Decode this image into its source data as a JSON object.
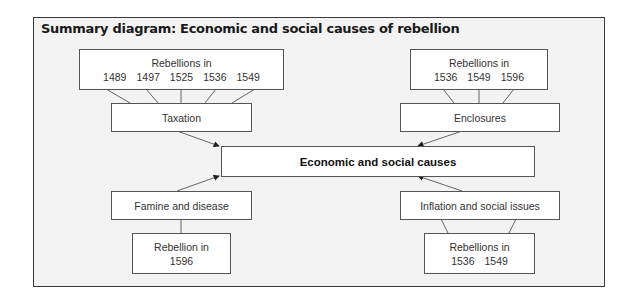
{
  "title": "Summary diagram: Economic and social causes of rebellion",
  "central": {
    "label": "Economic and social causes"
  },
  "causes": {
    "taxation": {
      "label": "Taxation",
      "rebellions_heading": "Rebellions in",
      "years": [
        "1489",
        "1497",
        "1525",
        "1536",
        "1549"
      ]
    },
    "enclosures": {
      "label": "Enclosures",
      "rebellions_heading": "Rebellions in",
      "years": [
        "1536",
        "1549",
        "1596"
      ]
    },
    "famine": {
      "label": "Famine and disease",
      "rebellions_heading": "Rebellion in",
      "years": [
        "1596"
      ]
    },
    "inflation": {
      "label": "Inflation and social issues",
      "rebellions_heading": "Rebellions in",
      "years": [
        "1536",
        "1549"
      ]
    }
  },
  "colors": {
    "frame_bg": "#f3f3f3",
    "box_bg": "#ffffff",
    "line": "#444444"
  }
}
